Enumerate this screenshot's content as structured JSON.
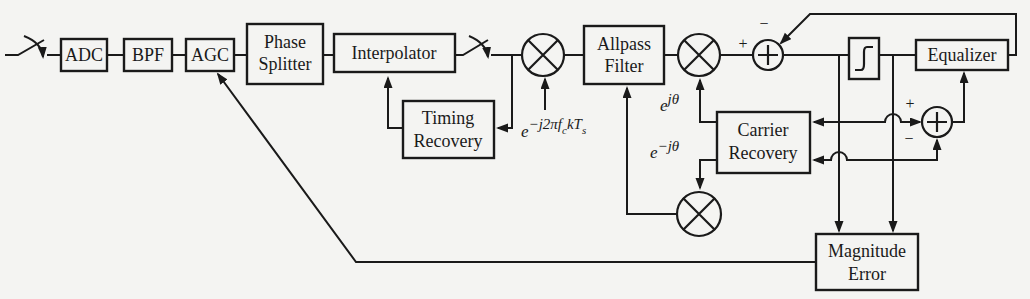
{
  "diagram": {
    "blocks": {
      "adc": {
        "label": "ADC"
      },
      "bpf": {
        "label": "BPF"
      },
      "agc": {
        "label": "AGC"
      },
      "phase_splitter": {
        "line1": "Phase",
        "line2": "Splitter"
      },
      "interpolator": {
        "label": "Interpolator"
      },
      "timing_recovery": {
        "line1": "Timing",
        "line2": "Recovery"
      },
      "allpass_filter": {
        "line1": "Allpass",
        "line2": "Filter"
      },
      "carrier_recovery": {
        "line1": "Carrier",
        "line2": "Recovery"
      },
      "equalizer": {
        "label": "Equalizer"
      },
      "magnitude_error": {
        "line1": "Magnitude",
        "line2": "Error"
      }
    },
    "labels": {
      "mixer_exponential": {
        "base": "e",
        "sup_prefix": "−j2π",
        "f": "f",
        "sub_c": "c",
        "kT": "kT",
        "sub_s": "s"
      },
      "rotator_positive": {
        "base": "e",
        "sup": "jθ"
      },
      "rotator_negative": {
        "base": "e",
        "sup": "−jθ"
      },
      "summer1_plus": "+",
      "summer1_minus": "−",
      "summer2_plus": "+",
      "summer2_minus": "−"
    },
    "colors": {
      "background": "#f4f4f2",
      "stroke": "#1a1a1a"
    }
  }
}
